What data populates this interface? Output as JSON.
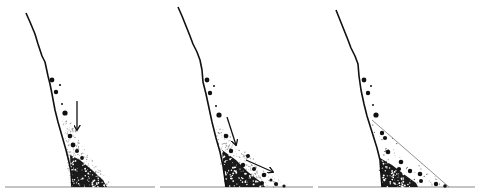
{
  "figure": {
    "description": "Three-panel sketch of rockfall talus accumulating at the foot of a cliff",
    "colors": {
      "ink": "#111111",
      "ground": "#8a8a8a",
      "fine": "#9a9a9a",
      "background": "#ffffff"
    },
    "panels": [
      {
        "id": "panel-1",
        "cliff": [
          [
            26,
            13
          ],
          [
            30,
            22
          ],
          [
            35,
            34
          ],
          [
            38,
            44
          ],
          [
            42,
            56
          ],
          [
            45,
            62
          ],
          [
            48,
            76
          ],
          [
            50,
            84
          ],
          [
            52,
            94
          ],
          [
            55,
            110
          ],
          [
            58,
            122
          ],
          [
            62,
            136
          ],
          [
            66,
            150
          ],
          [
            69,
            162
          ],
          [
            71,
            172
          ],
          [
            72,
            187
          ]
        ],
        "ground": [
          5,
          155
        ],
        "arrows": [
          {
            "from": [
              77,
              101
            ],
            "to": [
              77,
              130
            ]
          }
        ],
        "boulders": [
          [
            52,
            80,
            2.4
          ],
          [
            56,
            92,
            2.2
          ],
          [
            60,
            85,
            1.1
          ],
          [
            62,
            104,
            1.0
          ],
          [
            65,
            113,
            2.6
          ],
          [
            70,
            136,
            2.3
          ],
          [
            73,
            145,
            2.4
          ],
          [
            77,
            151,
            2.0
          ],
          [
            82,
            158,
            1.9
          ]
        ],
        "coarse_fill": [
          [
            70,
            155
          ],
          [
            80,
            160
          ],
          [
            92,
            170
          ],
          [
            103,
            180
          ],
          [
            107,
            187
          ],
          [
            72,
            187
          ]
        ],
        "fine_fill": [
          [
            62,
            120
          ],
          [
            72,
            122
          ],
          [
            80,
            140
          ],
          [
            90,
            158
          ],
          [
            100,
            170
          ],
          [
            110,
            183
          ],
          [
            106,
            187
          ],
          [
            70,
            187
          ]
        ],
        "talus_outline": null
      },
      {
        "id": "panel-2",
        "cliff": [
          [
            178,
            7
          ],
          [
            182,
            16
          ],
          [
            186,
            26
          ],
          [
            190,
            36
          ],
          [
            193,
            44
          ],
          [
            197,
            52
          ],
          [
            200,
            60
          ],
          [
            202,
            70
          ],
          [
            203,
            82
          ],
          [
            206,
            94
          ],
          [
            209,
            108
          ],
          [
            212,
            122
          ],
          [
            216,
            138
          ],
          [
            220,
            152
          ],
          [
            223,
            166
          ],
          [
            225,
            180
          ],
          [
            226,
            187
          ]
        ],
        "ground": [
          160,
          313
        ],
        "arrows": [
          {
            "from": [
              227,
              117
            ],
            "to": [
              236,
              145
            ]
          },
          {
            "from": [
              246,
              160
            ],
            "to": [
              273,
              172
            ]
          }
        ],
        "boulders": [
          [
            207,
            80,
            2.4
          ],
          [
            210,
            93,
            2.2
          ],
          [
            214,
            86,
            1.0
          ],
          [
            216,
            106,
            1.0
          ],
          [
            219,
            115,
            2.6
          ],
          [
            226,
            136,
            2.3
          ],
          [
            231,
            151,
            2.2
          ],
          [
            248,
            156,
            2.0
          ],
          [
            243,
            165,
            2.2
          ],
          [
            254,
            169,
            2.0
          ],
          [
            264,
            175,
            2.3
          ],
          [
            262,
            183,
            2.0
          ],
          [
            271,
            180,
            1.5
          ],
          [
            276,
            184,
            2.1
          ],
          [
            284,
            186,
            1.6
          ]
        ],
        "coarse_fill": [
          [
            222,
            150
          ],
          [
            236,
            160
          ],
          [
            248,
            172
          ],
          [
            262,
            183
          ],
          [
            265,
            187
          ],
          [
            225,
            187
          ]
        ],
        "fine_fill": [
          [
            215,
            125
          ],
          [
            224,
            128
          ],
          [
            238,
            145
          ],
          [
            255,
            160
          ],
          [
            272,
            175
          ],
          [
            288,
            185
          ],
          [
            286,
            187
          ],
          [
            224,
            187
          ]
        ],
        "talus_outline": null
      },
      {
        "id": "panel-3",
        "cliff": [
          [
            336,
            10
          ],
          [
            340,
            20
          ],
          [
            344,
            30
          ],
          [
            348,
            40
          ],
          [
            351,
            48
          ],
          [
            355,
            56
          ],
          [
            358,
            64
          ],
          [
            359,
            76
          ],
          [
            361,
            90
          ],
          [
            364,
            104
          ],
          [
            367,
            116
          ],
          [
            372,
            132
          ],
          [
            377,
            148
          ],
          [
            380,
            160
          ],
          [
            381,
            174
          ],
          [
            382,
            187
          ]
        ],
        "ground": [
          318,
          475
        ],
        "arrows": [],
        "boulders": [
          [
            364,
            80,
            2.4
          ],
          [
            368,
            93,
            2.2
          ],
          [
            371,
            86,
            1.0
          ],
          [
            373,
            105,
            1.0
          ],
          [
            376,
            115,
            2.6
          ],
          [
            382,
            133,
            2.2
          ],
          [
            385,
            138,
            2.1
          ],
          [
            388,
            152,
            2.3
          ],
          [
            401,
            162,
            2.3
          ],
          [
            399,
            169,
            2.1
          ],
          [
            410,
            171,
            2.2
          ],
          [
            420,
            174,
            2.3
          ],
          [
            421,
            181,
            2.0
          ],
          [
            436,
            184,
            2.2
          ],
          [
            445,
            186,
            1.8
          ]
        ],
        "coarse_fill": [
          [
            380,
            158
          ],
          [
            392,
            165
          ],
          [
            405,
            175
          ],
          [
            416,
            183
          ],
          [
            418,
            187
          ],
          [
            382,
            187
          ]
        ],
        "fine_fill": null,
        "talus_outline": [
          [
            372,
            120
          ],
          [
            449,
            187
          ]
        ]
      }
    ]
  }
}
